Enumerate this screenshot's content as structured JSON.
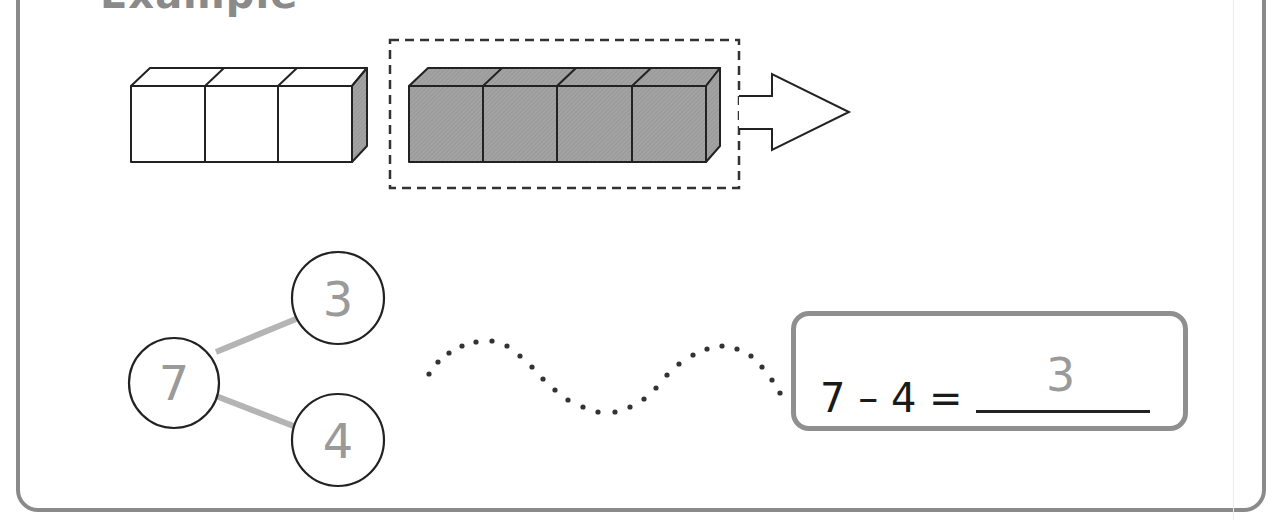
{
  "heading": {
    "title": "Example"
  },
  "cubes": {
    "white_count": 3,
    "shaded_count": 4,
    "white_fill": "#ffffff",
    "shaded_fill": "#a0a0a0",
    "outline_color": "#222222"
  },
  "arrow": {
    "direction": "right"
  },
  "number_bond": {
    "whole": "7",
    "part_top": "3",
    "part_bottom": "4",
    "line_color": "#b4b4b4",
    "number_color": "#9a9a9a"
  },
  "equation": {
    "expression": "7 – 4 =",
    "answer": "3",
    "box_border_color": "#8f8f8f"
  }
}
